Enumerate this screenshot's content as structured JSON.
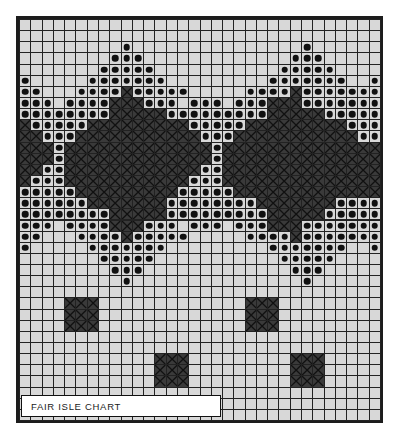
{
  "title": "FAIR ISLE CHART",
  "label": {
    "text": "FAIR ISLE CHART"
  },
  "colors": {
    "background": "#ffffff",
    "border": "#1c1c1c",
    "empty_cell": "#d8d8d8",
    "dot_cell_bg": "#d8d8d8",
    "dot_symbol": "#111111",
    "cross_cell": "#3a3a3a",
    "cross_stroke": "#111111",
    "gridline": "#222222",
    "label_bg": "#ffffff",
    "label_text": "#1a1a1a"
  },
  "chart_data": {
    "type": "heatmap",
    "title": "FAIR ISLE CHART",
    "xlabel": "",
    "ylabel": "",
    "columns": 32,
    "rows": 36,
    "cell_px": 11.28,
    "legend": [
      {
        "symbol": "empty",
        "code": ".",
        "name": "background-stitch"
      },
      {
        "symbol": "dot",
        "code": "o",
        "name": "contrast-dot-stitch"
      },
      {
        "symbol": "cross",
        "code": "x",
        "name": "cross-hatch-stitch"
      }
    ],
    "grid": [
      "................................",
      "................................",
      ".........o...............o......",
      "........ooo.............ooo.....",
      ".......ooooo...........ooooo....",
      "o.....ooooooo.........ooooooo..o",
      "oo...ooooxooooo.....ooooxooooooo",
      "ooo.ooooxxxooo.ooo.oooxxxooooooo",
      "ooooooooxxxxxoooooooooxxxxxooooo",
      "xoooooxxxxxxxxxoooooxxxxxxxxxooo",
      "xxoooxxxxxxxxxxxoooxxxxxxxxxxxoo",
      "xxxoxxxxxxxxxxxxxoxxxxxxxxxxxxxx",
      "xxxoxxxxxxxxxxxxxoxxxxxxxxxxxxxx",
      "xxooxxxxxxxxxxxxooxxxxxxxxxxxxxx",
      "xoooxxxxxxxxxxxoooxxxxxxxxxxxxxx",
      "oooooxxxxxxxxxoooooxxxxxxxxxxxxx",
      "ooooooxxxxxxxooooooooxxxxxxxoooo",
      "ooooooooxxxxxoooooooooxxxxxooooo",
      "ooo.ooooxxxooo.ooo.oooxxxooooooo",
      "oo...ooooxooooo.....ooooxooooooo",
      "o.....ooooooo.........ooooooo..o",
      ".......ooooo...........ooooo....",
      "........ooo.............ooo.....",
      ".........o...............o......",
      "................................",
      "....xxx.............xxx.........",
      "....xxx.............xxx.........",
      "....xxx.............xxx.........",
      "................................",
      "................................",
      "............xxx.........xxx.....",
      "............xxx.........xxx.....",
      "............xxx.........xxx.....",
      "................................",
      "................................",
      "................................"
    ]
  }
}
